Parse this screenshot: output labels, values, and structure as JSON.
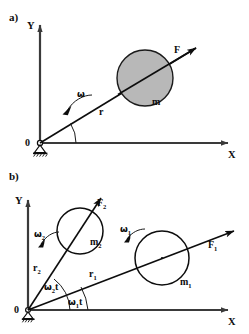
{
  "figure": {
    "background_color": "#ffffff",
    "ink_color": "#0d0d0d",
    "mass_fill_color": "#b8b8b8"
  },
  "panel_a": {
    "label": "a)",
    "axis_y": "Y",
    "axis_x": "X",
    "origin": "0",
    "omega": "ω",
    "radius": "r",
    "force": "F",
    "mass": "m"
  },
  "panel_b": {
    "label": "b)",
    "axis_y": "Y",
    "axis_x": "X",
    "origin": "0",
    "omega1_base": "ω",
    "omega1_sub": "1",
    "omega2_base": "ω",
    "omega2_sub": "2",
    "radius1_base": "r",
    "radius1_sub": "1",
    "radius2_base": "r",
    "radius2_sub": "2",
    "force1_base": "F",
    "force1_sub": "1",
    "force2_base": "F",
    "force2_sub": "2",
    "mass1_base": "m",
    "mass1_sub": "1",
    "mass2_base": "m",
    "mass2_sub": "2",
    "angle1_base": "ω",
    "angle1_sub": "1",
    "angle1_tail": "t",
    "angle2_base": "ω",
    "angle2_sub": "2",
    "angle2_tail": "t"
  }
}
